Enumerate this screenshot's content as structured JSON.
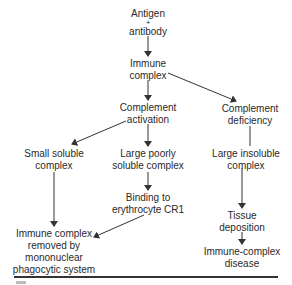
{
  "diagram": {
    "type": "flowchart",
    "nodes": {
      "antigen_antibody": {
        "line1": "Antigen",
        "line2": "+",
        "line3": "antibody"
      },
      "immune_complex": {
        "line1": "Immune",
        "line2": "complex"
      },
      "complement_activation": {
        "line1": "Complement",
        "line2": "activation"
      },
      "complement_deficiency": {
        "line1": "Complement",
        "line2": "deficiency"
      },
      "small_soluble_complex": {
        "line1": "Small soluble",
        "line2": "complex"
      },
      "large_poorly_soluble_complex": {
        "line1": "Large poorly",
        "line2": "soluble complex"
      },
      "large_insoluble_complex": {
        "line1": "Large insoluble",
        "line2": "complex"
      },
      "binding_erythrocyte_cr1": {
        "line1": "Binding to",
        "line2": "erythrocyte CR1"
      },
      "removed_by_mps": {
        "line1": "Immune complex",
        "line2": "removed by",
        "line3": "mononuclear",
        "line4": "phagocytic system"
      },
      "tissue_deposition": {
        "line1": "Tissue",
        "line2": "deposition"
      },
      "immune_complex_disease": {
        "line1": "Immune-complex",
        "line2": "disease"
      }
    },
    "edges": [
      {
        "from": "antigen_antibody",
        "to": "immune_complex"
      },
      {
        "from": "immune_complex",
        "to": "complement_activation"
      },
      {
        "from": "immune_complex",
        "to": "complement_deficiency"
      },
      {
        "from": "complement_activation",
        "to": "small_soluble_complex"
      },
      {
        "from": "complement_activation",
        "to": "large_poorly_soluble_complex"
      },
      {
        "from": "complement_deficiency",
        "to": "large_insoluble_complex"
      },
      {
        "from": "large_poorly_soluble_complex",
        "to": "binding_erythrocyte_cr1"
      },
      {
        "from": "small_soluble_complex",
        "to": "removed_by_mps"
      },
      {
        "from": "binding_erythrocyte_cr1",
        "to": "removed_by_mps"
      },
      {
        "from": "large_insoluble_complex",
        "to": "tissue_deposition"
      },
      {
        "from": "tissue_deposition",
        "to": "immune_complex_disease"
      }
    ],
    "colors": {
      "text": "#2a2a2a",
      "line": "#333333",
      "background": "#ffffff"
    }
  }
}
